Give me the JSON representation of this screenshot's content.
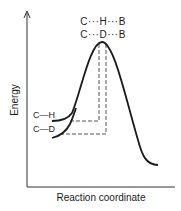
{
  "diagram": {
    "type": "energy-profile",
    "y_axis_label": "Energy",
    "x_axis_label": "Reaction coordinate",
    "transition_states": {
      "hydrogen": "C···H···B",
      "deuterium": "C···D···B"
    },
    "reactants": {
      "hydrogen": "C—H",
      "deuterium": "C—D"
    },
    "colors": {
      "line": "#1a1a1a",
      "dashed": "#555555",
      "background": "#ffffff"
    }
  }
}
